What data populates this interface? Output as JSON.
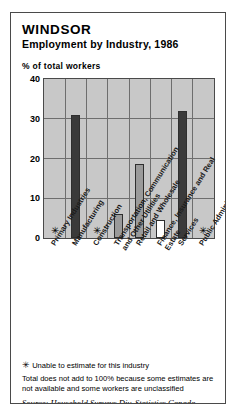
{
  "chart_data": {
    "type": "bar",
    "title": "WINDSOR",
    "subtitle": "Employment by Industry, 1986",
    "ylabel": "% of total workers",
    "xlabel": "",
    "ylim": [
      0,
      40
    ],
    "yticks": [
      0,
      10,
      20,
      30,
      40
    ],
    "ytick_labels": [
      "0",
      "10",
      "20",
      "30",
      "40"
    ],
    "grid": true,
    "legend": "none",
    "categories": [
      "Primary Industries",
      "Manufacturing",
      "Construction",
      "Transportation, Communication and Other Utilities",
      "Retail and Wholesale",
      "Finance, Insurance and Real Estate",
      "Services",
      "Public Administration"
    ],
    "values": [
      null,
      31,
      null,
      6,
      18.5,
      4.5,
      32,
      null
    ],
    "value_labels": [
      "*",
      "31",
      "*",
      "6",
      "18.5",
      "4.5",
      "32",
      "*"
    ],
    "bar_styles": [
      "none",
      "dark",
      "none",
      "mid",
      "mid",
      "light",
      "dark",
      "none"
    ],
    "unavailable_marker": "✳",
    "unavailable_categories": [
      "Primary Industries",
      "Construction",
      "Public Administration"
    ],
    "colors": {
      "bar_dark": "#3a3a3a",
      "bar_mid": "#9a9a9a",
      "bar_light": "#ffffff",
      "plot_background": "#c8c8c8",
      "gridline": "#6e6e6e",
      "border": "#4a4a4a"
    }
  },
  "footnotes": {
    "unavailable_note": "Unable to estimate for this industry",
    "total_note": "Total does not add to 100% because some estimates are not available and some workers are unclassified",
    "source": "Source: Household Surveys Div, Statistics Canada"
  }
}
